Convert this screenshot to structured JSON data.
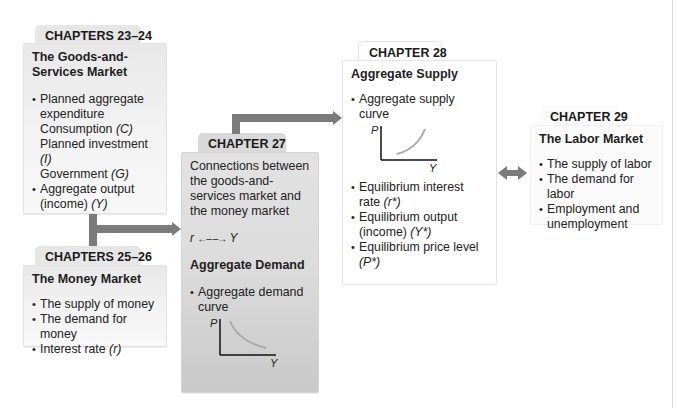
{
  "boxes": {
    "ch23_24": {
      "tab": "CHAPTERS 23–24",
      "heading": "The Goods-and-Services Market",
      "items": [
        {
          "text": "Planned aggregate expenditure",
          "bullet": true
        },
        {
          "text": "Consumption ",
          "var": "(C)",
          "bullet": false
        },
        {
          "text": "Planned investment ",
          "var": "(I)",
          "bullet": false
        },
        {
          "text": "Government ",
          "var": "(G)",
          "bullet": false
        },
        {
          "text": "Aggregate output (income) ",
          "var": "(Y)",
          "bullet": true
        }
      ]
    },
    "ch25_26": {
      "tab": "CHAPTERS 25–26",
      "heading": "The Money Market",
      "items": [
        {
          "text": "The supply of money",
          "bullet": true
        },
        {
          "text": "The demand for money",
          "bullet": true
        },
        {
          "text": "Interest rate ",
          "var": "(r)",
          "bullet": true
        }
      ]
    },
    "ch27": {
      "tab": "CHAPTER 27",
      "intro": "Connections between the goods-and-services market and the money market",
      "relation": {
        "left": "r",
        "arrow": "←– –→",
        "right": "Y"
      },
      "heading": "Aggregate Demand",
      "items": [
        {
          "text": "Aggregate demand curve",
          "bullet": true
        }
      ],
      "chart": {
        "y_label": "P",
        "x_label": "Y",
        "curve": "downward-sloping"
      }
    },
    "ch28": {
      "tab": "CHAPTER 28",
      "heading": "Aggregate Supply",
      "items": [
        {
          "text": "Aggregate supply curve",
          "bullet": true
        }
      ],
      "chart": {
        "y_label": "P",
        "x_label": "Y",
        "curve": "upward-sloping"
      },
      "items2": [
        {
          "text": "Equilibrium interest rate ",
          "var": "(r*)",
          "bullet": true
        },
        {
          "text": "Equilibrium output (income) ",
          "var": "(Y*)",
          "bullet": true
        },
        {
          "text": "Equilibrium price level ",
          "var": "(P*)",
          "bullet": true
        }
      ]
    },
    "ch29": {
      "tab": "CHAPTER 29",
      "heading": "The Labor Market",
      "items": [
        {
          "text": "The supply of labor",
          "bullet": true
        },
        {
          "text": "The demand for labor",
          "bullet": true
        },
        {
          "text": "Employment and unemployment",
          "bullet": true
        }
      ]
    }
  },
  "colors": {
    "connector": "#7b7b7b",
    "curve": "#9a9a9a"
  }
}
